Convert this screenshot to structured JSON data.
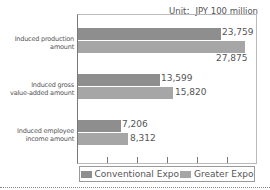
{
  "unit_label": "Unit：JPY 100 million",
  "chart_data": {
    "type": "bar",
    "orientation": "horizontal",
    "title": "",
    "unit": "JPY 100 million",
    "categories": [
      "Induced production amount",
      "Induced gross value-added amount",
      "Induced employee income amount"
    ],
    "category_lines": [
      [
        "Induced production",
        "amount"
      ],
      [
        "Induced gross",
        "value-added amount"
      ],
      [
        "Induced employee",
        "income amount"
      ]
    ],
    "series": [
      {
        "name": "Conventional Expo",
        "color": "#8e8e8e",
        "values": [
          23759,
          13599,
          7206
        ],
        "labels": [
          "23,759",
          "13,599",
          "7,206"
        ]
      },
      {
        "name": "Greater Expo",
        "color": "#a6a6a6",
        "values": [
          27875,
          15820,
          8312
        ],
        "labels": [
          "27,875",
          "15,820",
          "8,312"
        ]
      }
    ],
    "xlim": [
      0,
      30000
    ],
    "xticks": [
      0,
      5000,
      10000,
      15000,
      20000,
      25000,
      30000
    ],
    "grid": false,
    "legend_position": "bottom"
  }
}
